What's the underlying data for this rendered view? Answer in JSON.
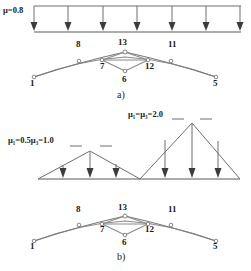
{
  "figure": {
    "title_a": "a)",
    "title_b": "b)",
    "type": "structural-load-diagram"
  },
  "diagram_a": {
    "load_label": "μ=0.8",
    "load_type": "uniform-distributed",
    "arrow_count": 7,
    "truss": {
      "nodes": [
        {
          "id": "1",
          "label": "1"
        },
        {
          "id": "8",
          "label": "8"
        },
        {
          "id": "7",
          "label": "7"
        },
        {
          "id": "13",
          "label": "13"
        },
        {
          "id": "6",
          "label": "6"
        },
        {
          "id": "12",
          "label": "12"
        },
        {
          "id": "11",
          "label": "11"
        },
        {
          "id": "5",
          "label": "5"
        }
      ]
    },
    "caption": "a)"
  },
  "diagram_b": {
    "load_label_left": "μ₁=0.5μ₃=1.0",
    "load_label_right": "μ₁=μ₃=2.0",
    "load_type": "triangular-distributed",
    "arrow_count_left": 3,
    "arrow_count_right": 3,
    "truss": {
      "nodes": [
        {
          "id": "1",
          "label": "1"
        },
        {
          "id": "8",
          "label": "8"
        },
        {
          "id": "7",
          "label": "7"
        },
        {
          "id": "13",
          "label": "13"
        },
        {
          "id": "6",
          "label": "6"
        },
        {
          "id": "12",
          "label": "12"
        },
        {
          "id": "11",
          "label": "11"
        },
        {
          "id": "5",
          "label": "5"
        }
      ]
    },
    "caption": "b)"
  },
  "colors": {
    "line": "#6e6e6e",
    "line_dark": "#3c3c3c",
    "text": "#1a1a1a",
    "background": "#ffffff"
  }
}
